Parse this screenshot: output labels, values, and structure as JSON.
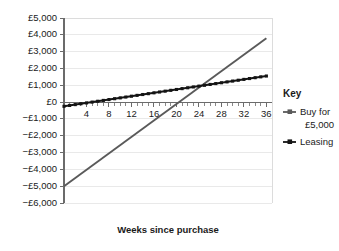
{
  "chart_data": {
    "type": "line",
    "title": "",
    "xlabel": "Weeks since purchase",
    "ylabel": "",
    "xlim": [
      0,
      37
    ],
    "ylim": [
      -6000,
      5000
    ],
    "grid": true,
    "legend_position": "right",
    "x_ticks": [
      4,
      8,
      12,
      16,
      20,
      24,
      28,
      32,
      36
    ],
    "x_tick_labels": [
      "4",
      "8",
      "12",
      "16",
      "20",
      "24",
      "28",
      "32",
      "36"
    ],
    "x_minor_tick_step": 1,
    "y_ticks": [
      5000,
      4000,
      3000,
      2000,
      1000,
      0,
      -1000,
      -2000,
      -3000,
      -4000,
      -5000,
      -6000
    ],
    "y_tick_labels": [
      "£5,000",
      "£4,000",
      "£3,000",
      "£2,000",
      "£1,000",
      "£0",
      "−£1,000",
      "−£2,000",
      "−£3,000",
      "−£4,000",
      "−£5,000",
      "−£6,000"
    ],
    "series": [
      {
        "name": "Buy for £5,000",
        "color": "#5a5a5a",
        "marker": "none",
        "x": [
          0,
          36
        ],
        "values": [
          -5000,
          3800
        ]
      },
      {
        "name": "Leasing",
        "color": "#141414",
        "marker": "square",
        "x": [
          0,
          36
        ],
        "values": [
          -250,
          1550
        ]
      }
    ]
  },
  "legend": {
    "title": "Key",
    "entries": [
      {
        "label_line1": "Buy for",
        "label_line2": "£5,000",
        "color": "#5a5a5a"
      },
      {
        "label_line1": "Leasing",
        "label_line2": "",
        "color": "#141414"
      }
    ]
  },
  "colors": {
    "buy_line": "#5a5a5a",
    "lease_line": "#141414",
    "grid": "#e9e9e9",
    "axis": "#6b6b6b",
    "background": "#ffffff",
    "text": "#1a1a1a"
  }
}
